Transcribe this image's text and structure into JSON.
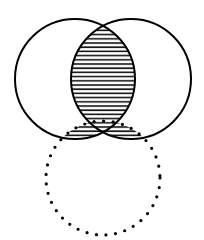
{
  "diagram": {
    "type": "venn",
    "colors": {
      "stroke": "#000000",
      "hatch": "#111111",
      "background": "#ffffff"
    },
    "circles": [
      {
        "name": "left-circle",
        "cx": 75,
        "cy": 79,
        "r": 60,
        "style": "solid"
      },
      {
        "name": "right-circle",
        "cx": 131,
        "cy": 79,
        "r": 60,
        "style": "solid"
      },
      {
        "name": "bottom-circle",
        "cx": 103,
        "cy": 178,
        "r": 57,
        "style": "dotted"
      }
    ],
    "shaded_regions": [
      "left-and-right-intersection",
      "left-and-bottom-intersection",
      "right-and-bottom-intersection"
    ]
  }
}
